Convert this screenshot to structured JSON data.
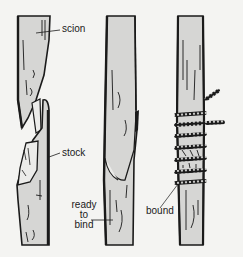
{
  "figure": {
    "colors": {
      "background": "#f4f4f2",
      "wood_fill": "#d6d6d4",
      "cut_fill": "#ececea",
      "ink": "#1a1a1a"
    },
    "panels": [
      {
        "id": "separated",
        "labels": [
          {
            "text": "scion"
          },
          {
            "text": "stock"
          }
        ]
      },
      {
        "id": "joined",
        "labels": [
          {
            "line1": "ready",
            "line2": "to",
            "line3": "bind"
          }
        ]
      },
      {
        "id": "bound",
        "labels": [
          {
            "text": "bound"
          }
        ]
      }
    ]
  }
}
